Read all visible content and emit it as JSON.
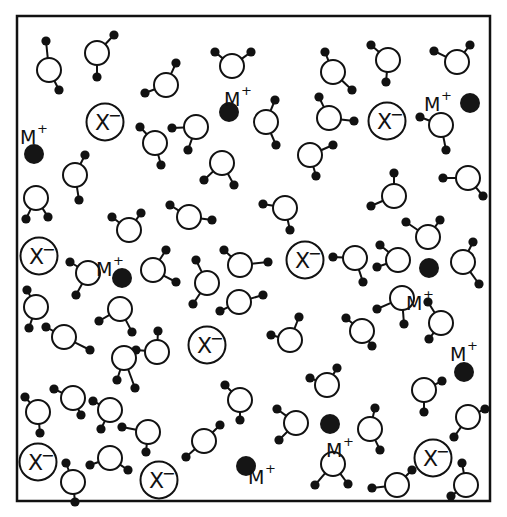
{
  "diagram": {
    "labels": {
      "cation": "M",
      "cation_charge": "+",
      "anion": "X",
      "anion_charge": "−"
    },
    "frame": {
      "x": 17,
      "y": 16,
      "width": 473,
      "height": 485
    },
    "water": [
      {
        "o": [
          49,
          70
        ],
        "h": [
          [
            46,
            41
          ],
          [
            59,
            90
          ]
        ]
      },
      {
        "o": [
          97,
          53
        ],
        "h": [
          [
            114,
            35
          ],
          [
            97,
            77
          ]
        ]
      },
      {
        "o": [
          166,
          85
        ],
        "h": [
          [
            176,
            63
          ],
          [
            145,
            93
          ]
        ]
      },
      {
        "o": [
          232,
          66
        ],
        "h": [
          [
            215,
            52
          ],
          [
            251,
            52
          ]
        ]
      },
      {
        "o": [
          155,
          143
        ],
        "h": [
          [
            140,
            127
          ],
          [
            161,
            165
          ]
        ]
      },
      {
        "o": [
          196,
          127
        ],
        "h": [
          [
            172,
            128
          ],
          [
            188,
            150
          ]
        ]
      },
      {
        "o": [
          222,
          163
        ],
        "h": [
          [
            204,
            180
          ],
          [
            234,
            185
          ]
        ]
      },
      {
        "o": [
          75,
          175
        ],
        "h": [
          [
            85,
            155
          ],
          [
            79,
            200
          ]
        ]
      },
      {
        "o": [
          36,
          198
        ],
        "h": [
          [
            26,
            219
          ],
          [
            48,
            217
          ]
        ]
      },
      {
        "o": [
          129,
          230
        ],
        "h": [
          [
            112,
            217
          ],
          [
            141,
            213
          ]
        ]
      },
      {
        "o": [
          189,
          217
        ],
        "h": [
          [
            170,
            205
          ],
          [
            212,
            220
          ]
        ]
      },
      {
        "o": [
          333,
          72
        ],
        "h": [
          [
            325,
            52
          ],
          [
            352,
            90
          ]
        ]
      },
      {
        "o": [
          388,
          60
        ],
        "h": [
          [
            371,
            45
          ],
          [
            386,
            82
          ]
        ]
      },
      {
        "o": [
          457,
          62
        ],
        "h": [
          [
            434,
            51
          ],
          [
            470,
            45
          ]
        ]
      },
      {
        "o": [
          266,
          122
        ],
        "h": [
          [
            275,
            100
          ],
          [
            276,
            145
          ]
        ]
      },
      {
        "o": [
          329,
          118
        ],
        "h": [
          [
            319,
            97
          ],
          [
            354,
            121
          ]
        ]
      },
      {
        "o": [
          441,
          125
        ],
        "h": [
          [
            420,
            117
          ],
          [
            446,
            150
          ]
        ]
      },
      {
        "o": [
          310,
          155
        ],
        "h": [
          [
            333,
            145
          ],
          [
            316,
            176
          ]
        ]
      },
      {
        "o": [
          394,
          196
        ],
        "h": [
          [
            394,
            173
          ],
          [
            371,
            206
          ]
        ]
      },
      {
        "o": [
          468,
          178
        ],
        "h": [
          [
            443,
            178
          ],
          [
            483,
            196
          ]
        ]
      },
      {
        "o": [
          285,
          208
        ],
        "h": [
          [
            263,
            204
          ],
          [
            290,
            230
          ]
        ]
      },
      {
        "o": [
          428,
          237
        ],
        "h": [
          [
            406,
            222
          ],
          [
            440,
            220
          ]
        ]
      },
      {
        "o": [
          88,
          273
        ],
        "h": [
          [
            70,
            262
          ],
          [
            76,
            295
          ]
        ]
      },
      {
        "o": [
          153,
          270
        ],
        "h": [
          [
            166,
            250
          ],
          [
            176,
            282
          ]
        ]
      },
      {
        "o": [
          36,
          307
        ],
        "h": [
          [
            27,
            290
          ],
          [
            29,
            328
          ]
        ]
      },
      {
        "o": [
          120,
          309
        ],
        "h": [
          [
            99,
            321
          ],
          [
            132,
            332
          ]
        ]
      },
      {
        "o": [
          64,
          337
        ],
        "h": [
          [
            46,
            327
          ],
          [
            90,
            350
          ]
        ]
      },
      {
        "o": [
          240,
          265
        ],
        "h": [
          [
            224,
            250
          ],
          [
            268,
            262
          ]
        ]
      },
      {
        "o": [
          207,
          283
        ],
        "h": [
          [
            196,
            260
          ],
          [
            193,
            304
          ]
        ]
      },
      {
        "o": [
          239,
          302
        ],
        "h": [
          [
            220,
            311
          ],
          [
            263,
            295
          ]
        ]
      },
      {
        "o": [
          355,
          258
        ],
        "h": [
          [
            333,
            257
          ],
          [
            363,
            282
          ]
        ]
      },
      {
        "o": [
          398,
          260
        ],
        "h": [
          [
            380,
            245
          ],
          [
            377,
            267
          ]
        ]
      },
      {
        "o": [
          463,
          262
        ],
        "h": [
          [
            473,
            242
          ],
          [
            479,
            284
          ]
        ]
      },
      {
        "o": [
          402,
          298
        ],
        "h": [
          [
            377,
            309
          ],
          [
            404,
            324
          ]
        ]
      },
      {
        "o": [
          362,
          331
        ],
        "h": [
          [
            346,
            318
          ],
          [
            372,
            346
          ]
        ]
      },
      {
        "o": [
          441,
          323
        ],
        "h": [
          [
            428,
            302
          ],
          [
            429,
            339
          ]
        ]
      },
      {
        "o": [
          290,
          340
        ],
        "h": [
          [
            271,
            335
          ],
          [
            299,
            317
          ]
        ]
      },
      {
        "o": [
          157,
          352
        ],
        "h": [
          [
            136,
            350
          ],
          [
            158,
            331
          ]
        ]
      },
      {
        "o": [
          124,
          358
        ],
        "h": [
          [
            117,
            380
          ],
          [
            135,
            388
          ]
        ]
      },
      {
        "o": [
          73,
          398
        ],
        "h": [
          [
            54,
            389
          ],
          [
            81,
            415
          ]
        ]
      },
      {
        "o": [
          38,
          412
        ],
        "h": [
          [
            25,
            397
          ],
          [
            40,
            433
          ]
        ]
      },
      {
        "o": [
          240,
          400
        ],
        "h": [
          [
            225,
            385
          ],
          [
            240,
            420
          ]
        ]
      },
      {
        "o": [
          110,
          410
        ],
        "h": [
          [
            93,
            401
          ],
          [
            101,
            429
          ]
        ]
      },
      {
        "o": [
          148,
          432
        ],
        "h": [
          [
            122,
            427
          ],
          [
            146,
            452
          ]
        ]
      },
      {
        "o": [
          204,
          441
        ],
        "h": [
          [
            186,
            457
          ],
          [
            220,
            425
          ]
        ]
      },
      {
        "o": [
          327,
          385
        ],
        "h": [
          [
            310,
            378
          ],
          [
            337,
            368
          ]
        ]
      },
      {
        "o": [
          296,
          423
        ],
        "h": [
          [
            277,
            409
          ],
          [
            279,
            440
          ]
        ]
      },
      {
        "o": [
          370,
          429
        ],
        "h": [
          [
            375,
            408
          ],
          [
            380,
            450
          ]
        ]
      },
      {
        "o": [
          424,
          390
        ],
        "h": [
          [
            442,
            381
          ],
          [
            424,
            412
          ]
        ]
      },
      {
        "o": [
          468,
          417
        ],
        "h": [
          [
            485,
            409
          ],
          [
            454,
            437
          ]
        ]
      },
      {
        "o": [
          73,
          482
        ],
        "h": [
          [
            66,
            463
          ],
          [
            75,
            502
          ]
        ]
      },
      {
        "o": [
          110,
          458
        ],
        "h": [
          [
            90,
            465
          ],
          [
            128,
            470
          ]
        ]
      },
      {
        "o": [
          333,
          464
        ],
        "h": [
          [
            315,
            485
          ],
          [
            348,
            484
          ]
        ]
      },
      {
        "o": [
          397,
          485
        ],
        "h": [
          [
            372,
            488
          ],
          [
            412,
            470
          ]
        ]
      },
      {
        "o": [
          466,
          485
        ],
        "h": [
          [
            462,
            463
          ],
          [
            451,
            496
          ]
        ]
      }
    ],
    "anions": [
      {
        "c": [
          105,
          122
        ]
      },
      {
        "c": [
          387,
          121
        ]
      },
      {
        "c": [
          39,
          256
        ]
      },
      {
        "c": [
          305,
          260
        ]
      },
      {
        "c": [
          207,
          345
        ]
      },
      {
        "c": [
          38,
          462
        ]
      },
      {
        "c": [
          159,
          480
        ]
      },
      {
        "c": [
          433,
          458
        ]
      }
    ],
    "cations": [
      {
        "c": [
          34,
          154
        ],
        "label": [
          28,
          136
        ]
      },
      {
        "c": [
          229,
          112
        ],
        "label": [
          232,
          98
        ]
      },
      {
        "c": [
          470,
          103
        ],
        "label": [
          432,
          103
        ]
      },
      {
        "c": [
          122,
          278
        ],
        "label": [
          104,
          268
        ]
      },
      {
        "c": [
          429,
          268
        ],
        "label": [
          414,
          302
        ]
      },
      {
        "c": [
          464,
          372
        ],
        "label": [
          458,
          353
        ]
      },
      {
        "c": [
          330,
          424
        ],
        "label": [
          334,
          449
        ]
      },
      {
        "c": [
          246,
          466
        ],
        "label": [
          256,
          476
        ]
      }
    ]
  }
}
